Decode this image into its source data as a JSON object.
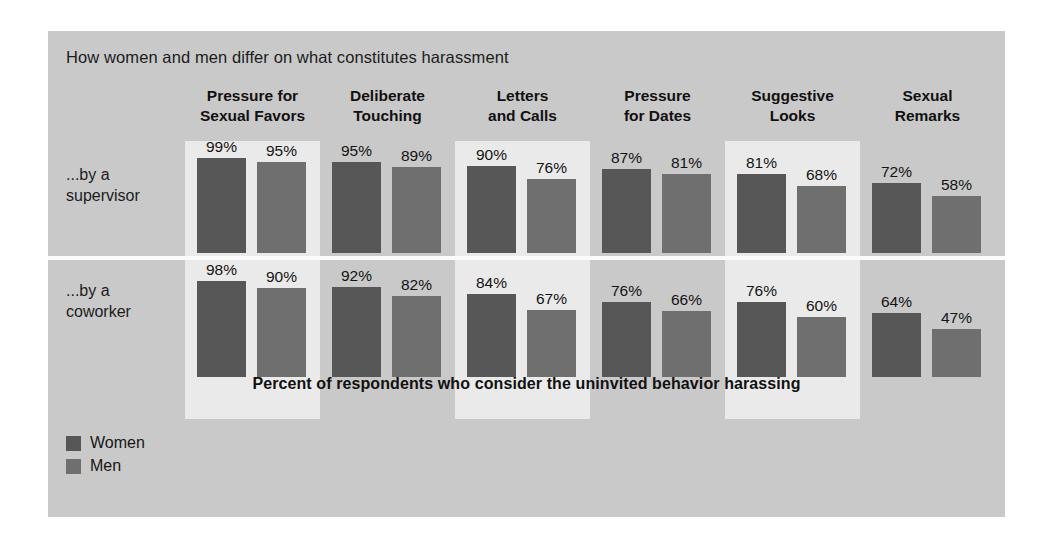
{
  "panel": {
    "title": "How women and men differ on what constitutes harassment",
    "caption": "Percent of respondents who consider the uninvited behavior harassing",
    "background_color": "#c9c9c9",
    "band_color": "#eaeaea"
  },
  "legend": {
    "items": [
      {
        "label": "Women",
        "color": "#575757"
      },
      {
        "label": "Men",
        "color": "#6f6f6f"
      }
    ]
  },
  "chart_data": {
    "type": "bar",
    "title": "How women and men differ on what constitutes harassment",
    "subtitle": "Percent of respondents who consider the uninvited behavior harassing",
    "xlabel": "",
    "ylabel": "Percent of respondents",
    "ylim": [
      0,
      100
    ],
    "grid": false,
    "legend_position": "bottom-left",
    "categories": [
      "Pressure for Sexual Favors",
      "Deliberate Touching",
      "Letters and Calls",
      "Pressure for Dates",
      "Suggestive Looks",
      "Sexual Remarks"
    ],
    "category_lines": [
      [
        "Pressure for",
        "Sexual Favors"
      ],
      [
        "Deliberate",
        "Touching"
      ],
      [
        "Letters",
        "and Calls"
      ],
      [
        "Pressure",
        "for Dates"
      ],
      [
        "Suggestive",
        "Looks"
      ],
      [
        "Sexual",
        "Remarks"
      ]
    ],
    "groups": [
      {
        "label": "...by a supervisor",
        "label_lines": [
          "...by a",
          "supervisor"
        ],
        "series": [
          {
            "name": "Women",
            "values": [
              99,
              95,
              90,
              87,
              81,
              72
            ],
            "labels": [
              "99%",
              "95%",
              "90%",
              "87%",
              "81%",
              "72%"
            ]
          },
          {
            "name": "Men",
            "values": [
              95,
              89,
              76,
              81,
              68,
              58
            ],
            "labels": [
              "95%",
              "89%",
              "76%",
              "81%",
              "68%",
              "58%"
            ]
          }
        ]
      },
      {
        "label": "...by a coworker",
        "label_lines": [
          "...by a",
          "coworker"
        ],
        "series": [
          {
            "name": "Women",
            "values": [
              98,
              92,
              84,
              76,
              76,
              64
            ],
            "labels": [
              "98%",
              "92%",
              "84%",
              "76%",
              "76%",
              "64%"
            ]
          },
          {
            "name": "Men",
            "values": [
              90,
              82,
              67,
              66,
              60,
              47
            ],
            "labels": [
              "90%",
              "82%",
              "67%",
              "66%",
              "60%",
              "47%"
            ]
          }
        ]
      }
    ],
    "highlighted_category_indices": [
      0,
      2,
      4
    ]
  }
}
